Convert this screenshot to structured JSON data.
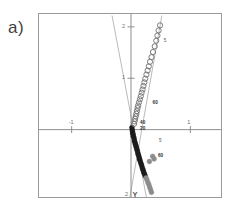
{
  "figure": {
    "panel_label": "a)"
  },
  "chart_data": {
    "type": "scatter",
    "title": "",
    "xlabel": "X",
    "ylabel": "Y",
    "axis_names": {
      "x": "X",
      "y": "Y"
    },
    "xlim": [
      -1.55,
      1.55
    ],
    "ylim": [
      2.25,
      -1.35
    ],
    "grid": false,
    "legend_position": "none",
    "x_ticks": [
      {
        "value": -1,
        "label": "-1"
      },
      {
        "value": 1,
        "label": "1"
      }
    ],
    "y_ticks": [
      {
        "value": 1,
        "label": "1"
      },
      {
        "value": 2,
        "label": "2"
      }
    ],
    "annotations": [
      {
        "text": "60",
        "x": 0.42,
        "y": -0.52
      },
      {
        "text": "5",
        "x": 0.44,
        "y": -0.22
      },
      {
        "text": "20",
        "x": 0.12,
        "y": 0.02
      },
      {
        "text": "40",
        "x": 0.12,
        "y": 0.12
      },
      {
        "text": "60",
        "x": 0.33,
        "y": 0.52
      },
      {
        "text": "5",
        "x": 0.52,
        "y": 1.72
      }
    ],
    "fit_lines": [
      {
        "name": "left-branch",
        "x1": 0.26,
        "y1": -1.32,
        "x2": -0.32,
        "y2": 2.22
      },
      {
        "name": "right-branch",
        "x1": -0.02,
        "y1": -1.32,
        "x2": 0.52,
        "y2": 2.22
      }
    ],
    "series": [
      {
        "name": "filled-markers",
        "marker": "filled-circle",
        "color": "#1c1c1c",
        "points": [
          [
            0.015,
            0.04
          ],
          [
            0.02,
            0.0
          ],
          [
            0.025,
            -0.04
          ],
          [
            0.03,
            -0.07
          ],
          [
            0.035,
            -0.1
          ],
          [
            0.04,
            -0.13
          ],
          [
            0.05,
            -0.16
          ],
          [
            0.055,
            -0.2
          ],
          [
            0.06,
            -0.23
          ],
          [
            0.07,
            -0.26
          ],
          [
            0.075,
            -0.29
          ],
          [
            0.085,
            -0.32
          ],
          [
            0.09,
            -0.35
          ],
          [
            0.1,
            -0.38
          ],
          [
            0.105,
            -0.41
          ],
          [
            0.115,
            -0.45
          ],
          [
            0.12,
            -0.48
          ],
          [
            0.13,
            -0.51
          ],
          [
            0.14,
            -0.55
          ],
          [
            0.145,
            -0.58
          ],
          [
            0.155,
            -0.61
          ],
          [
            0.165,
            -0.65
          ],
          [
            0.175,
            -0.68
          ],
          [
            0.185,
            -0.72
          ],
          [
            0.195,
            -0.76
          ],
          [
            0.205,
            -0.79
          ],
          [
            0.215,
            -0.83
          ],
          [
            0.225,
            -0.86
          ],
          [
            0.24,
            -0.9
          ]
        ]
      },
      {
        "name": "gray-markers",
        "marker": "filled-circle",
        "color": "#8c8c8c",
        "points": [
          [
            0.255,
            -0.94
          ],
          [
            0.27,
            -0.98
          ],
          [
            0.285,
            -1.03
          ],
          [
            0.3,
            -1.07
          ],
          [
            0.315,
            -1.12
          ],
          [
            0.33,
            -1.17
          ],
          [
            0.345,
            -1.22
          ],
          [
            0.31,
            -0.62
          ],
          [
            0.365,
            -0.52
          ],
          [
            0.39,
            -0.57
          ]
        ]
      },
      {
        "name": "open-markers",
        "marker": "open-circle",
        "color": "#6e6e6e",
        "points": [
          [
            0.05,
            0.11
          ],
          [
            0.06,
            0.16
          ],
          [
            0.07,
            0.21
          ],
          [
            0.08,
            0.26
          ],
          [
            0.09,
            0.31
          ],
          [
            0.1,
            0.36
          ],
          [
            0.11,
            0.42
          ],
          [
            0.12,
            0.47
          ],
          [
            0.135,
            0.53
          ],
          [
            0.15,
            0.59
          ],
          [
            0.165,
            0.65
          ],
          [
            0.18,
            0.72
          ],
          [
            0.195,
            0.78
          ],
          [
            0.21,
            0.85
          ],
          [
            0.225,
            0.92
          ],
          [
            0.24,
            0.99
          ],
          [
            0.26,
            1.07
          ],
          [
            0.28,
            1.15
          ],
          [
            0.3,
            1.23
          ],
          [
            0.32,
            1.32
          ],
          [
            0.345,
            1.41
          ],
          [
            0.37,
            1.51
          ],
          [
            0.4,
            1.62
          ],
          [
            0.425,
            1.73
          ],
          [
            0.445,
            1.83
          ],
          [
            0.465,
            1.93
          ],
          [
            0.49,
            2.03
          ]
        ]
      }
    ]
  }
}
